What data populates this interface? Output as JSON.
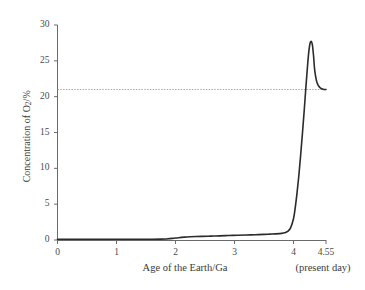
{
  "chart_data": {
    "type": "line",
    "title": "",
    "xlabel": "Age of the Earth/Ga",
    "ylabel": "Concentration of O2/%",
    "ylabel_parts": {
      "prefix": "Concentration of O",
      "subscript": "2",
      "suffix": "/%"
    },
    "xlim": [
      0,
      4.55
    ],
    "ylim": [
      0,
      30
    ],
    "grid": false,
    "legend": null,
    "x_ticks": [
      "0",
      "1",
      "2",
      "3",
      "4",
      "4.55"
    ],
    "x_tick_values": [
      0,
      1,
      2,
      3,
      4,
      4.55
    ],
    "y_ticks": [
      "0",
      "5",
      "10",
      "15",
      "20",
      "25",
      "30"
    ],
    "y_tick_values": [
      0,
      5,
      10,
      15,
      20,
      25,
      30
    ],
    "annotations": [
      {
        "text": "(present day)",
        "x": 4.4,
        "y": -3.6
      }
    ],
    "reference_lines": [
      {
        "name": "present-day-oxygen-level",
        "orientation": "horizontal",
        "value": 21,
        "label": "21",
        "style": "dotted",
        "color": "#9a9a9a",
        "x_start": 0,
        "x_end": 4.55
      }
    ],
    "series": [
      {
        "name": "Atmospheric O2 concentration",
        "color": "#2b2b2b",
        "x": [
          0.0,
          0.2,
          0.4,
          0.6,
          0.8,
          1.0,
          1.2,
          1.4,
          1.6,
          1.75,
          1.85,
          1.95,
          2.05,
          2.15,
          2.25,
          2.35,
          2.45,
          2.55,
          2.65,
          2.75,
          2.9,
          3.05,
          3.2,
          3.35,
          3.5,
          3.6,
          3.7,
          3.8,
          3.85,
          3.9,
          3.95,
          4.0,
          4.03,
          4.06,
          4.09,
          4.12,
          4.15,
          4.18,
          4.21,
          4.24,
          4.26,
          4.28,
          4.3,
          4.32,
          4.34,
          4.36,
          4.4,
          4.45,
          4.5,
          4.55
        ],
        "y": [
          0.1,
          0.1,
          0.1,
          0.1,
          0.1,
          0.1,
          0.1,
          0.1,
          0.1,
          0.12,
          0.15,
          0.22,
          0.32,
          0.4,
          0.45,
          0.48,
          0.5,
          0.52,
          0.55,
          0.58,
          0.62,
          0.66,
          0.7,
          0.74,
          0.78,
          0.82,
          0.86,
          0.92,
          1.0,
          1.2,
          1.7,
          3.0,
          4.6,
          6.6,
          9.0,
          11.8,
          14.8,
          18.0,
          21.4,
          24.6,
          26.4,
          27.45,
          27.7,
          27.2,
          25.6,
          23.6,
          21.9,
          21.25,
          21.05,
          21.0
        ]
      }
    ]
  },
  "axes": {
    "y_axis_name": "concentration-axis",
    "x_axis_name": "age-axis"
  }
}
